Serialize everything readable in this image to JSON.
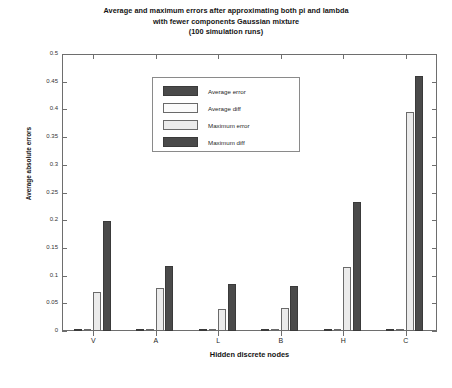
{
  "chart_data": {
    "type": "bar",
    "title": "Average and maximum errors after approximating both pi and lambda with fewer components Gaussian mixture (100 simulation runs)",
    "title_lines": [
      "Average and maximum errors after approximating both pi and lambda",
      "with fewer components Gaussian mixture",
      "(100 simulation runs)"
    ],
    "xlabel": "Hidden discrete nodes",
    "ylabel": "Average absolute errors",
    "categories": [
      "V",
      "A",
      "L",
      "B",
      "H",
      "C"
    ],
    "ylim": [
      0,
      0.5
    ],
    "ytick_labels": [
      "0",
      "0.05",
      "0.1",
      "0.15",
      "0.2",
      "0.25",
      "0.3",
      "0.35",
      "0.4",
      "0.45",
      "0.5"
    ],
    "ytick_values": [
      0,
      0.05,
      0.1,
      0.15,
      0.2,
      0.25,
      0.3,
      0.35,
      0.4,
      0.45,
      0.5
    ],
    "grid": false,
    "legend_position": "upper center",
    "series": [
      {
        "name": "Average error",
        "color": "#4a4a4a",
        "values": [
          0.002,
          0.002,
          0.002,
          0.002,
          0.003,
          0.003
        ]
      },
      {
        "name": "Average diff",
        "color": "#fbfbfb",
        "values": [
          0.003,
          0.003,
          0.003,
          0.003,
          0.004,
          0.004
        ]
      },
      {
        "name": "Maximum error",
        "color": "#ebebeb",
        "values": [
          0.07,
          0.077,
          0.04,
          0.042,
          0.115,
          0.395
        ]
      },
      {
        "name": "Maximum diff",
        "color": "#4a4a4a",
        "values": [
          0.199,
          0.118,
          0.084,
          0.081,
          0.232,
          0.46
        ]
      }
    ]
  }
}
